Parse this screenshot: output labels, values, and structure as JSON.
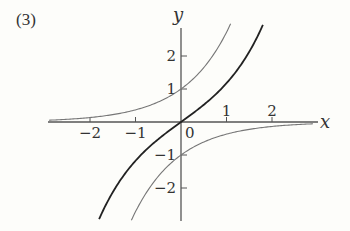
{
  "problem_label": "(3)",
  "chart_data": {
    "type": "line",
    "title": "",
    "xlabel": "x",
    "ylabel": "y",
    "origin_label": "0",
    "xlim": [
      -2.9,
      3.1
    ],
    "ylim": [
      -3.0,
      3.0
    ],
    "x_ticks": [
      -2,
      -1,
      1,
      2
    ],
    "x_tick_labels": [
      "−2",
      "−1",
      "1",
      "2"
    ],
    "y_ticks": [
      2,
      1,
      -1,
      -2
    ],
    "y_tick_labels": [
      "2",
      "1",
      "−1",
      "−2"
    ],
    "grid": false,
    "legend": null,
    "series": [
      {
        "name": "y = e^x",
        "style": "thin-gray",
        "color": "#777777",
        "points": [
          [
            -2.9,
            0.055
          ],
          [
            -2,
            0.135
          ],
          [
            -1,
            0.368
          ],
          [
            0,
            1
          ],
          [
            0.5,
            1.649
          ],
          [
            1,
            2.718
          ],
          [
            1.09,
            2.97
          ]
        ]
      },
      {
        "name": "y = -e^(-x)",
        "style": "thin-gray",
        "color": "#777777",
        "points": [
          [
            -1.09,
            -2.97
          ],
          [
            -1,
            -2.718
          ],
          [
            -0.5,
            -1.649
          ],
          [
            0,
            -1
          ],
          [
            1,
            -0.368
          ],
          [
            2,
            -0.135
          ],
          [
            2.9,
            -0.055
          ]
        ]
      },
      {
        "name": "y = (e^x - e^(-x))/2",
        "style": "thick-black",
        "color": "#222222",
        "points": [
          [
            -1.8,
            -2.94
          ],
          [
            -1.5,
            -2.13
          ],
          [
            -1,
            -1.175
          ],
          [
            -0.5,
            -0.521
          ],
          [
            0,
            0
          ],
          [
            0.5,
            0.521
          ],
          [
            1,
            1.175
          ],
          [
            1.5,
            2.13
          ],
          [
            1.8,
            2.94
          ]
        ]
      }
    ]
  }
}
